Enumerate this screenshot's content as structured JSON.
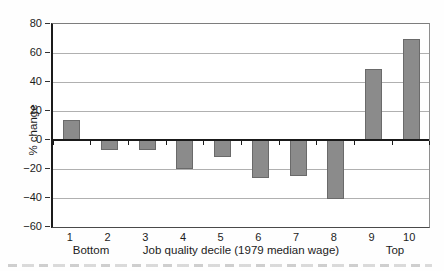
{
  "chart_data": {
    "type": "bar",
    "title": "",
    "ylabel": "% change",
    "xlabel": "Job quality decile (1979 median wage)",
    "x_end_labels": {
      "left": "Bottom",
      "right": "Top"
    },
    "categories": [
      "1",
      "2",
      "3",
      "4",
      "5",
      "6",
      "7",
      "8",
      "9",
      "10"
    ],
    "values": [
      14,
      -7,
      -7,
      -20,
      -12,
      -26,
      -25,
      -41,
      49,
      70
    ],
    "ylim": [
      -60,
      80
    ],
    "yticks": [
      80,
      60,
      40,
      20,
      0,
      -20,
      -40,
      -60
    ],
    "grid": true,
    "legend_position": "none",
    "bar_color": "#8b8b8b",
    "bar_edge_color": "#6a6a6a",
    "axis_color": "#1a1a1a"
  }
}
